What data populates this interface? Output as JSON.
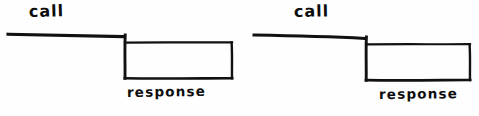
{
  "figure": {
    "background_color": "#fefefe",
    "ink_color": "#111111",
    "style": "hand-drawn marker sketch",
    "diagrams": [
      {
        "id": "diagram-left",
        "call_label": "call",
        "response_label": "response",
        "call_line": {
          "x1": 8,
          "y1": 34,
          "x2": 125,
          "y2": 37
        },
        "response_box": {
          "x": 125,
          "y": 42,
          "width": 107,
          "height": 36
        },
        "drop_edge": {
          "x": 125,
          "y1": 35,
          "y2": 78
        }
      },
      {
        "id": "diagram-right",
        "call_label": "call",
        "response_label": "response",
        "call_line": {
          "x1": 254,
          "y1": 35,
          "x2": 366,
          "y2": 39
        },
        "response_box": {
          "x": 366,
          "y": 44,
          "width": 104,
          "height": 36
        },
        "drop_edge": {
          "x": 366,
          "y1": 37,
          "y2": 80
        }
      }
    ]
  }
}
